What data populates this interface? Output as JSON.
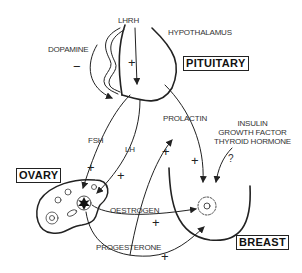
{
  "diagram": {
    "organs": {
      "hypothalamus": "HYPOTHALAMUS",
      "pituitary": "PITUITARY",
      "ovary": "OVARY",
      "breast": "BREAST"
    },
    "hormones": {
      "lhrh": "LHRH",
      "dopamine": "DOPAMINE",
      "fsh": "FSH",
      "lh": "LH",
      "prolactin": "PROLACTIN",
      "oestrogen": "OESTROGEN",
      "progesterone": "PROGESTERONE",
      "other_factors": [
        "INSULIN",
        "GROWTH FACTOR",
        "THYROID HORMONE"
      ]
    },
    "signs": {
      "dopamine_effect": "−",
      "lhrh_effect": "+",
      "fsh_effect": "+",
      "lh_effect": "+",
      "prolactin_effect": "+",
      "pituitary_breast_effect": "+",
      "other_factors_effect": "?",
      "oestrogen_effect": "+",
      "progesterone_effect": "+"
    }
  }
}
